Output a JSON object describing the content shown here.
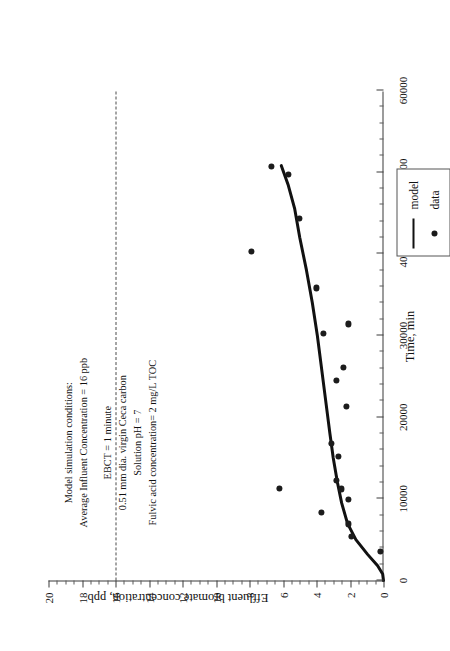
{
  "chart_data": {
    "type": "scatter",
    "title": "",
    "xlabel": "Time, min",
    "ylabel": "Effluent bromate concentration, ppb",
    "xlim": [
      0,
      60000
    ],
    "ylim": [
      0,
      20
    ],
    "xticks": [
      0,
      10000,
      20000,
      30000,
      40000,
      50000,
      60000
    ],
    "xtick_labels": [
      "0",
      "10000",
      "20000",
      "30000",
      "40000",
      "50000",
      "60000"
    ],
    "yticks": [
      0,
      2,
      4,
      6,
      8,
      10,
      12,
      14,
      16,
      18,
      20
    ],
    "ytick_labels": [
      "0",
      "2",
      "4",
      "6",
      "8",
      "10",
      "12",
      "14",
      "16",
      "18",
      "20"
    ],
    "x_minor_interval": 2000,
    "y_minor_interval": 0.5,
    "grid": false,
    "legend_position": "bottom-right-outside",
    "legend": [
      {
        "name": "model",
        "marker": "line",
        "color": "#111111"
      },
      {
        "name": "data",
        "marker": "dot",
        "color": "#1a1a1a"
      }
    ],
    "threshold": {
      "label": "Average Influent Concentration",
      "value": 16,
      "axis": "y",
      "style": "dashed",
      "color": "#4a4a4a"
    },
    "series": [
      {
        "name": "data",
        "type": "scatter",
        "points": [
          {
            "x": 3500,
            "y": 0.2
          },
          {
            "x": 5400,
            "y": 1.9
          },
          {
            "x": 6900,
            "y": 2.1
          },
          {
            "x": 8300,
            "y": 3.7
          },
          {
            "x": 9900,
            "y": 2.1
          },
          {
            "x": 11200,
            "y": 2.5
          },
          {
            "x": 11300,
            "y": 6.2
          },
          {
            "x": 12200,
            "y": 2.8
          },
          {
            "x": 15200,
            "y": 2.7
          },
          {
            "x": 16800,
            "y": 3.1
          },
          {
            "x": 21300,
            "y": 2.2
          },
          {
            "x": 24500,
            "y": 2.8
          },
          {
            "x": 26100,
            "y": 2.4
          },
          {
            "x": 30200,
            "y": 3.6
          },
          {
            "x": 31400,
            "y": 2.1
          },
          {
            "x": 35800,
            "y": 4.0
          },
          {
            "x": 40300,
            "y": 7.9
          },
          {
            "x": 44300,
            "y": 5.0
          },
          {
            "x": 49700,
            "y": 5.7
          },
          {
            "x": 50700,
            "y": 6.7
          }
        ]
      },
      {
        "name": "model",
        "type": "line",
        "points": [
          {
            "x": 0,
            "y": 0.0
          },
          {
            "x": 800,
            "y": 0.05
          },
          {
            "x": 1800,
            "y": 0.35
          },
          {
            "x": 3200,
            "y": 0.95
          },
          {
            "x": 5000,
            "y": 1.65
          },
          {
            "x": 7000,
            "y": 2.15
          },
          {
            "x": 9500,
            "y": 2.5
          },
          {
            "x": 12000,
            "y": 2.75
          },
          {
            "x": 15000,
            "y": 3.0
          },
          {
            "x": 18000,
            "y": 3.2
          },
          {
            "x": 22000,
            "y": 3.45
          },
          {
            "x": 26000,
            "y": 3.7
          },
          {
            "x": 30000,
            "y": 3.95
          },
          {
            "x": 34000,
            "y": 4.25
          },
          {
            "x": 38000,
            "y": 4.6
          },
          {
            "x": 42000,
            "y": 5.0
          },
          {
            "x": 45500,
            "y": 5.3
          },
          {
            "x": 48500,
            "y": 5.7
          },
          {
            "x": 50800,
            "y": 6.1
          }
        ]
      }
    ],
    "annotation": {
      "lines_group_1": [
        "Model simulation conditions:",
        "Average Influent Concentration = 16 ppb"
      ],
      "lines_group_2": [
        "EBCT = 1 minute",
        "0.51 mm dia. virgin Ceca carbon",
        "Solution pH = 7",
        "Fulvic acid concentration= 2 mg/L TOC"
      ]
    }
  }
}
